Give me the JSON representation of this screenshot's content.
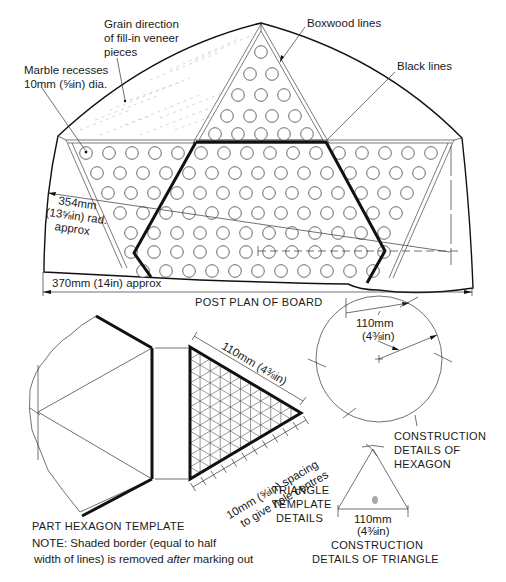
{
  "figure": {
    "board_plan": {
      "caption": "POST PLAN OF BOARD",
      "labels": {
        "grain": [
          "Grain direction",
          "of fill-in veneer",
          "pieces"
        ],
        "marble": [
          "Marble recesses",
          "10mm (⅝in) dia."
        ],
        "boxwood": "Boxwood lines",
        "black": "Black lines",
        "radius": [
          "354mm",
          "(13⅝in) rad.",
          "approx"
        ],
        "width": "370mm (14in) approx"
      }
    },
    "hexagon_template": {
      "caption": "PART HEXAGON TEMPLATE",
      "note_prefix": "NOTE: Shaded border (equal to half",
      "note_line2_a": "width of lines) is removed ",
      "note_line2_em": "after",
      "note_line2_b": " marking out"
    },
    "triangle_template": {
      "side_label": "110mm (4⅜in)",
      "spacing_label_1": "10mm (⅝in) spacing",
      "spacing_label_2": "to give hole centres",
      "caption": [
        "TRIANGLE",
        "TEMPLATE",
        "DETAILS"
      ]
    },
    "hexagon_construction": {
      "radius_label": [
        "110mm",
        "(4⅜in)"
      ],
      "caption": [
        "CONSTRUCTION",
        "DETAILS OF",
        "HEXAGON"
      ]
    },
    "triangle_construction": {
      "side_label": [
        "110mm",
        "(4⅜in)"
      ],
      "caption": [
        "CONSTRUCTION",
        "DETAILS OF TRIANGLE"
      ]
    }
  }
}
